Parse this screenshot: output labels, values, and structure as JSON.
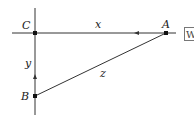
{
  "diagram": {
    "type": "right-triangle-vector",
    "points": {
      "A": {
        "label": "A",
        "x": 166,
        "y": 33
      },
      "B": {
        "label": "B",
        "x": 35,
        "y": 96
      },
      "C": {
        "label": "C",
        "x": 35,
        "y": 33
      }
    },
    "edges": {
      "x": {
        "label": "x",
        "from": "A",
        "to": "C",
        "arrow": "left"
      },
      "y": {
        "label": "y",
        "from": "B",
        "to": "C",
        "arrow": "up"
      },
      "z": {
        "label": "z",
        "from": "B",
        "to": "A"
      }
    },
    "side_box": {
      "label": "W"
    },
    "colors": {
      "line": "#222222",
      "background": "#ffffff"
    }
  }
}
